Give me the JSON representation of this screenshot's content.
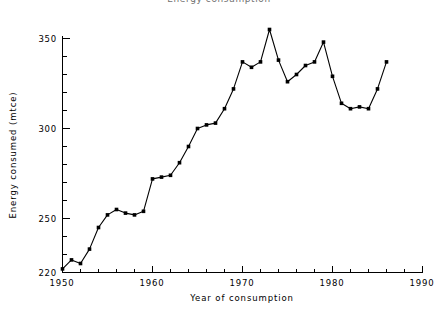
{
  "chart_data": {
    "type": "line",
    "title": "Energy consumption",
    "xlabel": "Year of consumption",
    "ylabel": "Energy consumed (mtce)",
    "xlim": [
      1950,
      1990
    ],
    "ylim": [
      220,
      350
    ],
    "grid": false,
    "legend": null,
    "x_major_ticks": [
      1950,
      1960,
      1970,
      1980,
      1990
    ],
    "x_major_tick_labels": [
      "1950",
      "1960",
      "1970",
      "1980",
      "1990"
    ],
    "x_minor_tick_step": 2,
    "y_major_ticks": [
      220,
      250,
      300,
      350
    ],
    "y_major_tick_labels": [
      "220",
      "250",
      "300",
      "350"
    ],
    "y_minor_tick_step": 10,
    "marker": "filled-square",
    "line_color": "#000000",
    "marker_color": "#000000",
    "series": [
      {
        "name": "Energy consumed",
        "x": [
          1950,
          1951,
          1952,
          1953,
          1954,
          1955,
          1956,
          1957,
          1958,
          1959,
          1960,
          1961,
          1962,
          1963,
          1964,
          1965,
          1966,
          1967,
          1968,
          1969,
          1970,
          1971,
          1972,
          1973,
          1974,
          1975,
          1976,
          1977,
          1978,
          1979,
          1980,
          1981,
          1982,
          1983,
          1984,
          1985,
          1986
        ],
        "values": [
          222,
          227,
          225,
          233,
          245,
          252,
          255,
          253,
          252,
          254,
          272,
          273,
          274,
          281,
          290,
          300,
          302,
          303,
          311,
          322,
          337,
          334,
          337,
          355,
          338,
          326,
          330,
          335,
          337,
          348,
          329,
          314,
          311,
          312,
          311,
          322,
          337
        ]
      }
    ]
  }
}
